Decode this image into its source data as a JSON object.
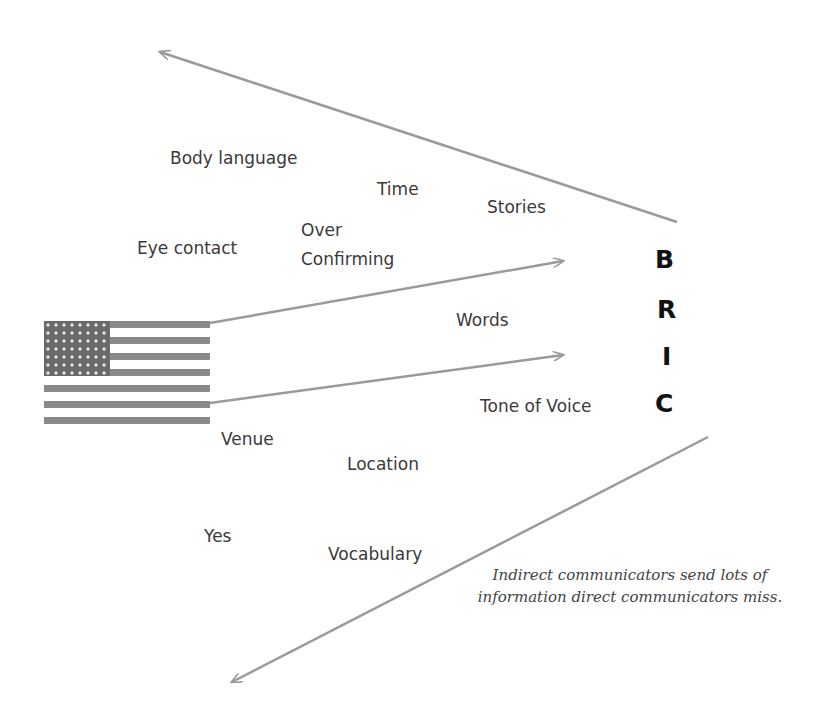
{
  "diagram": {
    "type": "communication-flow",
    "sender": {
      "icon": "us-flag-icon",
      "label": ""
    },
    "receiver": {
      "letters": [
        "B",
        "R",
        "I",
        "C"
      ]
    },
    "labels": {
      "body_language": "Body language",
      "time": "Time",
      "stories": "Stories",
      "eye_contact": "Eye contact",
      "over_confirming_1": "Over",
      "over_confirming_2": "Confirming",
      "words": "Words",
      "tone_of_voice": "Tone of Voice",
      "venue": "Venue",
      "location": "Location",
      "yes": "Yes",
      "vocabulary": "Vocabulary"
    },
    "caption": "Indirect communicators send lots of information direct communicators miss.",
    "colors": {
      "arrow": "#9a9a9a",
      "text": "#3a3a3a",
      "bric": "#111111"
    }
  }
}
